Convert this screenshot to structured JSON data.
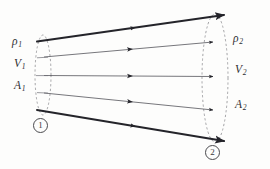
{
  "figure": {
    "kind": "stream-tube-diagram",
    "title": "",
    "background_color": "#fdfdfc",
    "stroke_color": "#2e2e32",
    "dashed_color": "#8a8a8e",
    "thick_stroke_width": 2.0,
    "thin_stroke_width": 0.7,
    "dash_stroke_width": 0.8
  },
  "labels": {
    "inlet": {
      "density": {
        "symbol": "ρ",
        "subscript": "1",
        "x": 12,
        "y": 42
      },
      "velocity": {
        "symbol": "V",
        "subscript": "1",
        "x": 14,
        "y": 64
      },
      "area": {
        "symbol": "A",
        "subscript": "1",
        "x": 14,
        "y": 85
      }
    },
    "outlet": {
      "density": {
        "symbol": "ρ",
        "subscript": "2",
        "x": 232,
        "y": 33
      },
      "velocity": {
        "symbol": "V",
        "subscript": "2",
        "x": 234,
        "y": 65
      },
      "area": {
        "symbol": "A",
        "subscript": "2",
        "x": 234,
        "y": 100
      }
    }
  },
  "stations": {
    "inlet": {
      "text": "1",
      "x": 33,
      "y": 118
    },
    "outlet": {
      "text": "2",
      "x": 205,
      "y": 145
    }
  },
  "geometry": {
    "inlet_ellipse": {
      "cx": 43,
      "cy": 75,
      "rx": 8,
      "ry": 40
    },
    "outlet_ellipse": {
      "cx": 215,
      "cy": 78,
      "rx": 13,
      "ry": 64
    },
    "tube_boundaries": [
      {
        "name": "upper-boundary",
        "x1": 37,
        "y1": 41,
        "x2": 224,
        "y2": 15,
        "weight": "thick",
        "arrow_mid_t": 0.52
      },
      {
        "name": "lower-boundary",
        "x1": 37,
        "y1": 110,
        "x2": 224,
        "y2": 141,
        "weight": "thick",
        "arrow_mid_t": 0.52
      }
    ],
    "streamlines": [
      {
        "name": "streamline-upper",
        "x1": 44,
        "y1": 57,
        "x2": 212,
        "y2": 42,
        "weight": "thin",
        "arrow_mid_t": 0.46
      },
      {
        "name": "streamline-center",
        "x1": 44,
        "y1": 75,
        "x2": 212,
        "y2": 76,
        "weight": "thin",
        "arrow_mid_t": 0.46
      },
      {
        "name": "streamline-lower",
        "x1": 44,
        "y1": 93,
        "x2": 212,
        "y2": 110,
        "weight": "thin",
        "arrow_mid_t": 0.46
      }
    ]
  }
}
